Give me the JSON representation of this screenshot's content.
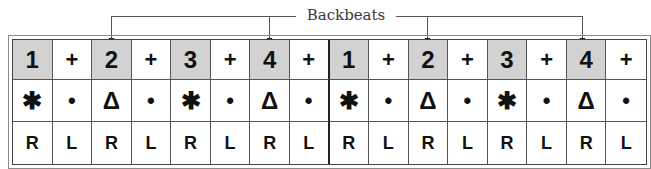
{
  "annotation": {
    "label": "Backbeats",
    "targets_columns": [
      3,
      7,
      11,
      15
    ]
  },
  "grid": {
    "columns": 16,
    "divider_after_column": 8,
    "shade_color": "#d2d2d2",
    "rows": {
      "count": [
        "1",
        "+",
        "2",
        "+",
        "3",
        "+",
        "4",
        "+",
        "1",
        "+",
        "2",
        "+",
        "3",
        "+",
        "4",
        "+"
      ],
      "instrument": [
        "✱",
        "•",
        "Δ",
        "•",
        "✱",
        "•",
        "Δ",
        "•",
        "✱",
        "•",
        "Δ",
        "•",
        "✱",
        "•",
        "Δ",
        "•"
      ],
      "sticking": [
        "R",
        "L",
        "R",
        "L",
        "R",
        "L",
        "R",
        "L",
        "R",
        "L",
        "R",
        "L",
        "R",
        "L",
        "R",
        "L"
      ]
    },
    "shaded_columns": [
      1,
      3,
      5,
      7,
      9,
      11,
      13,
      15
    ]
  },
  "legend_semantics": {
    "✱": "bass-drum",
    "•": "hi-hat",
    "Δ": "snare"
  }
}
